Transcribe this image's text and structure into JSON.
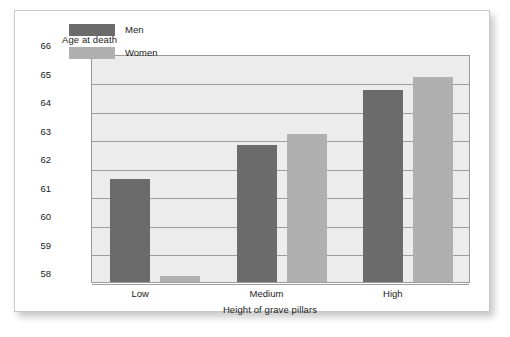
{
  "chart_data": {
    "type": "bar",
    "title": "",
    "xlabel": "Height of grave pillars",
    "ylabel": "Age at death",
    "categories": [
      "Low",
      "Medium",
      "High"
    ],
    "series": [
      {
        "name": "Men",
        "color": "#6b6b6b",
        "values": [
          61.6,
          62.8,
          64.75
        ]
      },
      {
        "name": "Women",
        "color": "#b0b0b0",
        "values": [
          58.2,
          63.2,
          65.2
        ]
      }
    ],
    "ylim": [
      58,
      66
    ],
    "yticks": [
      66,
      65,
      64,
      63,
      62,
      61,
      60,
      59,
      58
    ],
    "ytick_labels": [
      "66",
      "65",
      "64",
      "63",
      "62",
      "61",
      "60",
      "59",
      "58"
    ],
    "grid": true,
    "legend_position": "inside-top-left",
    "plot_background": "#ececec",
    "gridline_color": "#9d9d9d",
    "axis_color": "#9a9a9a"
  },
  "axis": {
    "y_title": "Age at death",
    "x_title": "Height of grave pillars"
  },
  "legend": {
    "items": [
      {
        "label": "Men"
      },
      {
        "label": "Women"
      }
    ]
  }
}
